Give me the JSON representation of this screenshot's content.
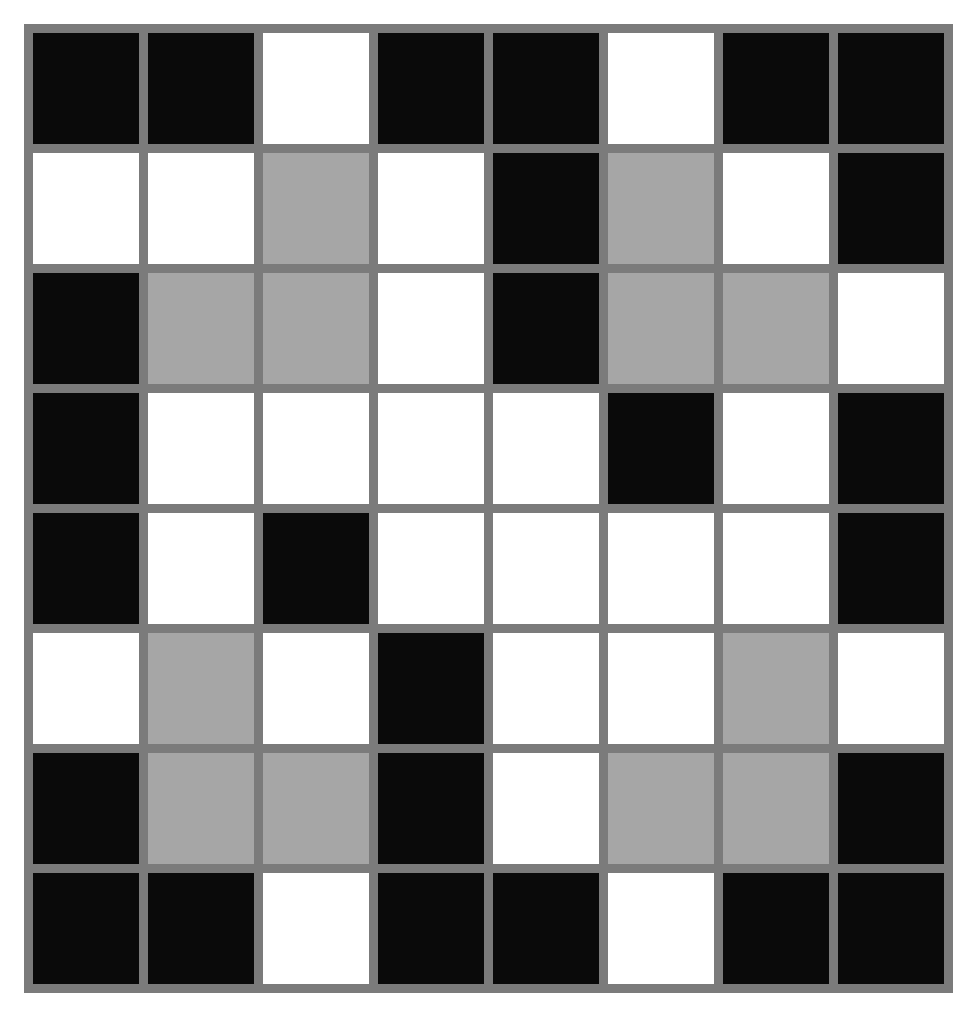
{
  "board": {
    "rows": 8,
    "cols": 8,
    "colors": {
      "B": "#0a0a0a",
      "W": "#ffffff",
      "G": "#a6a6a6",
      "border": "#7b7b7b"
    },
    "legend": {
      "B": "black",
      "W": "white",
      "G": "gray"
    },
    "grid": [
      [
        "B",
        "B",
        "W",
        "B",
        "B",
        "W",
        "B",
        "B"
      ],
      [
        "W",
        "W",
        "G",
        "W",
        "B",
        "G",
        "W",
        "B"
      ],
      [
        "B",
        "G",
        "G",
        "W",
        "B",
        "G",
        "G",
        "W"
      ],
      [
        "B",
        "W",
        "W",
        "W",
        "W",
        "B",
        "W",
        "B"
      ],
      [
        "B",
        "W",
        "B",
        "W",
        "W",
        "W",
        "W",
        "B"
      ],
      [
        "W",
        "G",
        "W",
        "B",
        "W",
        "W",
        "G",
        "W"
      ],
      [
        "B",
        "G",
        "G",
        "B",
        "W",
        "G",
        "G",
        "B"
      ],
      [
        "B",
        "B",
        "W",
        "B",
        "B",
        "W",
        "B",
        "B"
      ]
    ]
  }
}
